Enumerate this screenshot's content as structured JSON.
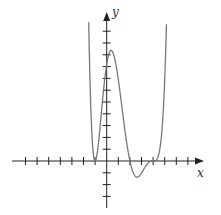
{
  "chart_data": {
    "type": "line",
    "title": "",
    "xlabel": "x",
    "ylabel": "y",
    "grid": false,
    "legend": null,
    "tick_labels": "none",
    "x_ticks": [
      -7,
      -6,
      -5,
      -4,
      -3,
      -2,
      -1,
      1,
      2,
      3,
      4,
      5,
      6,
      7
    ],
    "y_ticks": [
      -3,
      -2,
      -1,
      1,
      2,
      3,
      4,
      5,
      6,
      7,
      8,
      9,
      10,
      11
    ],
    "xlim": [
      -8,
      8.3
    ],
    "ylim": [
      -3.8,
      12.5
    ],
    "function": "y = 0.064 (x+1)^2 (x-2) (x-4)^3",
    "features": {
      "touch_zero": -1,
      "crossing_zero": 2,
      "inflection_zero": 4,
      "local_max": {
        "x": 0.3,
        "y": 9.3
      },
      "local_min": {
        "x": 2.5,
        "y": -1.3
      }
    },
    "series": [
      {
        "name": "f(x)",
        "x": [
          -1.55,
          -1.4,
          -1.2,
          -1.0,
          -0.8,
          -0.5,
          -0.2,
          0.0,
          0.3,
          0.6,
          1.0,
          1.4,
          1.8,
          2.0,
          2.3,
          2.5,
          2.8,
          3.2,
          3.6,
          4.0,
          4.4,
          4.7,
          5.0,
          5.15
        ],
        "y": [
          11.8,
          5.5,
          1.5,
          0.0,
          1.2,
          4.2,
          7.3,
          8.2,
          9.3,
          8.8,
          6.9,
          3.9,
          1.4,
          0.0,
          -1.1,
          -1.3,
          -1.2,
          -0.6,
          -0.1,
          0.0,
          0.1,
          0.4,
          1.2,
          11.6
        ]
      }
    ]
  },
  "colors": {
    "axis": "#222222",
    "curve": "#777777",
    "background": "#ffffff"
  }
}
